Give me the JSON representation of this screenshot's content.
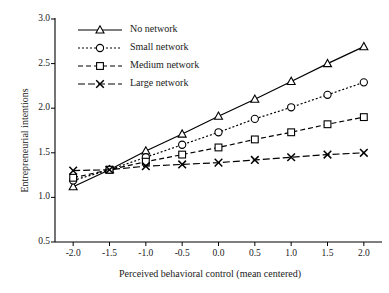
{
  "chart_data": {
    "type": "line",
    "title": "",
    "xlabel": "Perceived behavioral control (mean centered)",
    "ylabel": "Entrepreneurial intentions",
    "x": [
      -2.0,
      -1.5,
      -1.0,
      -0.5,
      0.0,
      0.5,
      1.0,
      1.5,
      2.0
    ],
    "xtick_labels": [
      "-2.0",
      "-1.5",
      "-1.0",
      "-0.5",
      "0.0",
      "0.5",
      "1.0",
      "1.5",
      "2.0"
    ],
    "ytick_labels": [
      "0.5",
      "1.0",
      "1.5",
      "2.0",
      "2.5",
      "3.0"
    ],
    "yticks": [
      0.5,
      1.0,
      1.5,
      2.0,
      2.5,
      3.0
    ],
    "xlim": [
      -2.25,
      2.25
    ],
    "ylim": [
      0.5,
      3.0
    ],
    "grid": false,
    "legend_position": "top-left",
    "series": [
      {
        "name": "No network",
        "marker": "triangle",
        "dash": "solid",
        "color": "#000000",
        "values": [
          1.12,
          1.31,
          1.52,
          1.71,
          1.91,
          2.1,
          2.3,
          2.5,
          2.69
        ]
      },
      {
        "name": "Small network",
        "marker": "circle",
        "dash": "dotted",
        "color": "#000000",
        "values": [
          1.19,
          1.31,
          1.45,
          1.59,
          1.73,
          1.88,
          2.01,
          2.15,
          2.29
        ]
      },
      {
        "name": "Medium network",
        "marker": "square",
        "dash": "dashed",
        "color": "#000000",
        "values": [
          1.22,
          1.31,
          1.4,
          1.48,
          1.56,
          1.65,
          1.73,
          1.82,
          1.9
        ]
      },
      {
        "name": "Large network",
        "marker": "cross",
        "dash": "longdash",
        "color": "#000000",
        "values": [
          1.3,
          1.31,
          1.35,
          1.37,
          1.39,
          1.42,
          1.45,
          1.48,
          1.5
        ]
      }
    ]
  }
}
